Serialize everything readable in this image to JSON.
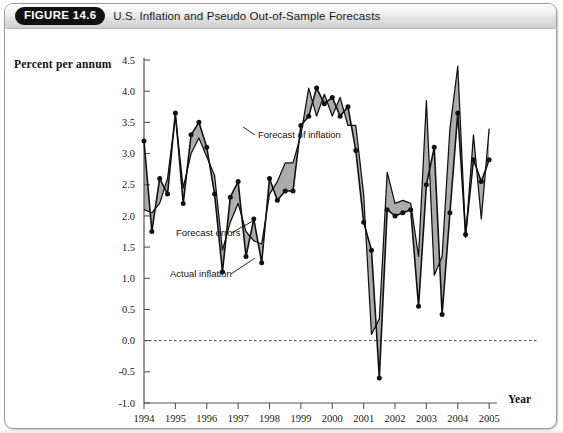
{
  "header": {
    "figure_number": "FIGURE 14.6",
    "title": "U.S. Inflation and Pseudo Out-of-Sample Forecasts"
  },
  "axes": {
    "ylabel": "Percent per annum",
    "xlabel": "Year",
    "y_ticks": [
      "4.5",
      "4.0",
      "3.5",
      "3.0",
      "2.5",
      "2.0",
      "1.5",
      "1.0",
      "0.5",
      "0.0",
      "-0.5",
      "-1.0"
    ],
    "x_ticks": [
      "1994",
      "1995",
      "1996",
      "1997",
      "1998",
      "1999",
      "2000",
      "2001",
      "2002",
      "2003",
      "2004",
      "2005"
    ]
  },
  "annotations": {
    "forecast_of_inflation": "Forecast of inflation",
    "forecast_errors": "Forecast errors",
    "actual_inflation": "Actual inflation"
  },
  "colors": {
    "line": "#111111",
    "fill": "#a8a8a8",
    "axis": "#555555",
    "zero_line": "#444444",
    "accent_pill": "#111111"
  },
  "chart_data": {
    "type": "line",
    "title": "U.S. Inflation and Pseudo Out-of-Sample Forecasts",
    "xlabel": "Year",
    "ylabel": "Percent per annum",
    "xlim": [
      1994.0,
      2005.25
    ],
    "ylim": [
      -1.0,
      4.5
    ],
    "yticks": [
      -1.0,
      -0.5,
      0.0,
      0.5,
      1.0,
      1.5,
      2.0,
      2.5,
      3.0,
      3.5,
      4.0,
      4.5
    ],
    "xticks": [
      1994,
      1995,
      1996,
      1997,
      1998,
      1999,
      2000,
      2001,
      2002,
      2003,
      2004,
      2005
    ],
    "grid": false,
    "legend": "none",
    "zero_reference_line": 0.0,
    "markers_on": "actual_inflation",
    "shaded_region": "area between actual inflation and forecast of inflation (forecast errors)",
    "x": [
      1994.0,
      1994.25,
      1994.5,
      1994.75,
      1995.0,
      1995.25,
      1995.5,
      1995.75,
      1996.0,
      1996.25,
      1996.5,
      1996.75,
      1997.0,
      1997.25,
      1997.5,
      1997.75,
      1998.0,
      1998.25,
      1998.5,
      1998.75,
      1999.0,
      1999.25,
      1999.5,
      1999.75,
      2000.0,
      2000.25,
      2000.5,
      2000.75,
      2001.0,
      2001.25,
      2001.5,
      2001.75,
      2002.0,
      2002.25,
      2002.5,
      2002.75,
      2003.0,
      2003.25,
      2003.5,
      2003.75,
      2004.0,
      2004.25,
      2004.5,
      2004.75,
      2005.0
    ],
    "series": [
      {
        "name": "Actual inflation",
        "style": "solid-with-markers",
        "values": [
          3.2,
          1.75,
          2.6,
          2.35,
          3.65,
          2.2,
          3.3,
          3.5,
          3.1,
          2.35,
          1.1,
          2.3,
          2.55,
          1.35,
          1.95,
          1.25,
          2.6,
          2.25,
          2.4,
          2.4,
          3.45,
          3.6,
          4.05,
          3.8,
          3.9,
          3.6,
          3.75,
          3.05,
          1.9,
          1.45,
          -0.6,
          2.1,
          2.0,
          2.05,
          2.1,
          0.55,
          2.5,
          3.1,
          0.42,
          2.05,
          3.65,
          1.7,
          2.9,
          2.55,
          2.9
        ]
      },
      {
        "name": "Forecast of inflation",
        "style": "solid",
        "values": [
          2.1,
          2.05,
          2.2,
          2.6,
          3.6,
          2.45,
          3.0,
          3.25,
          2.95,
          2.65,
          1.45,
          1.9,
          2.2,
          1.75,
          1.6,
          1.55,
          2.35,
          2.55,
          2.85,
          2.85,
          3.3,
          4.05,
          3.6,
          3.95,
          3.6,
          3.9,
          3.45,
          3.45,
          2.35,
          0.1,
          0.35,
          2.7,
          2.2,
          2.25,
          2.2,
          1.35,
          3.85,
          1.05,
          1.35,
          3.4,
          4.4,
          1.65,
          3.3,
          1.95,
          3.4
        ]
      }
    ]
  }
}
